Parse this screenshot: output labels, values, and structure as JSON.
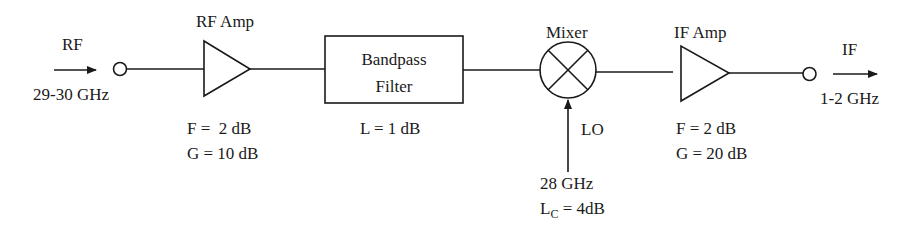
{
  "input": {
    "label": "RF",
    "freq": "29-30 GHz"
  },
  "rf_amp": {
    "title": "RF Amp",
    "noise_figure": "F =  2 dB",
    "gain": "G = 10 dB"
  },
  "filter": {
    "title_line1": "Bandpass",
    "title_line2": "Filter",
    "loss": "L = 1 dB"
  },
  "mixer": {
    "title": "Mixer",
    "lo_label": "LO",
    "lo_freq": "28 GHz",
    "conv_loss_prefix": "L",
    "conv_loss_sub": "C",
    "conv_loss_value": " = 4dB"
  },
  "if_amp": {
    "title": "IF Amp",
    "noise_figure": "F = 2 dB",
    "gain": "G = 20 dB"
  },
  "output": {
    "label": "IF",
    "freq": "1-2 GHz"
  },
  "colors": {
    "stroke": "#1a1a1a",
    "background": "#ffffff"
  }
}
